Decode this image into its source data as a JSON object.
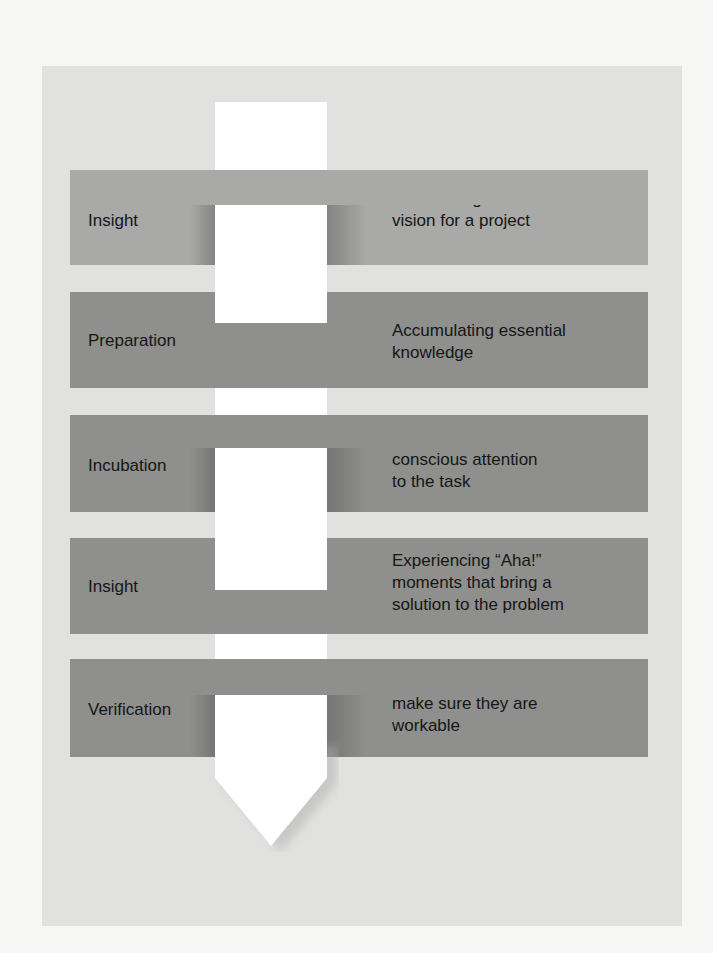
{
  "diagram": {
    "title": "",
    "type": "vertical-arrow-stages",
    "colors": {
      "page_background": "#f6f6f4",
      "card_background": "#e1e1df",
      "panel_light": "#a9a9a7",
      "panel_dark": "#8f8f8d",
      "arrow": "#ffffff",
      "text": "#161616"
    },
    "stages": [
      {
        "name": "First\nInsight",
        "name_lines": [
          "First",
          "Insight"
        ],
        "description_lines": [
          "Formulating the initial",
          "vision for a project"
        ],
        "shade": "light"
      },
      {
        "name": "Preparation",
        "name_lines": [
          "Preparation"
        ],
        "description_lines": [
          "Accumulating essential",
          "knowledge"
        ],
        "shade": "dark"
      },
      {
        "name": "Incubation",
        "name_lines": [
          "Incubation"
        ],
        "description_lines": [
          "Taking breaks from",
          "conscious attention",
          "to the task"
        ],
        "shade": "dark"
      },
      {
        "name": "Insight",
        "name_lines": [
          "Insight"
        ],
        "description_lines": [
          "Experiencing “Aha!”",
          "moments that bring a",
          "solution to the problem"
        ],
        "shade": "dark"
      },
      {
        "name": "Verification",
        "name_lines": [
          "Verification"
        ],
        "description_lines": [
          "Testing insights to",
          "make sure they are",
          "workable"
        ],
        "shade": "dark"
      }
    ]
  }
}
